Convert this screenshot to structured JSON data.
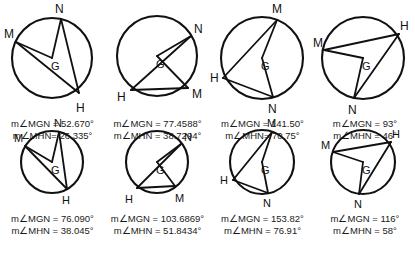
{
  "page": {
    "background_color": "#ffffff",
    "ink_color": "#111111",
    "rows": 2,
    "columns": 4
  },
  "vertex_names": {
    "m": "M",
    "n": "N",
    "h": "H",
    "g": "G"
  },
  "figures": [
    {
      "id": "figure-1",
      "position": "row1-col1",
      "measure_mgn": "m∠MGN = 52.670°",
      "measure_mhn": "m∠MHN= 26.335°",
      "center": {
        "label": "G",
        "cx": 52,
        "cy": 58,
        "r": 40
      },
      "points": {
        "M": {
          "x": 16,
          "y": 42,
          "label_x": 4,
          "label_y": 38
        },
        "N": {
          "x": 61,
          "y": 19,
          "label_x": 55,
          "label_y": 13
        },
        "H": {
          "x": 79,
          "y": 93,
          "label_x": 76,
          "label_y": 112
        }
      },
      "segments": [
        {
          "from": "M",
          "to": "G"
        },
        {
          "from": "M",
          "to": "H"
        },
        {
          "from": "N",
          "to": "G"
        },
        {
          "from": "N",
          "to": "H"
        }
      ]
    },
    {
      "id": "figure-2",
      "position": "row1-col2",
      "measure_mgn": "m∠MGN = 77.4588°",
      "measure_mhn": "m∠MHN = 38.7294°",
      "center": {
        "label": "G",
        "cx": 52,
        "cy": 56,
        "r": 40
      },
      "points": {
        "N": {
          "x": 86,
          "y": 36,
          "label_x": 89,
          "label_y": 33
        },
        "M": {
          "x": 83,
          "y": 88,
          "label_x": 87,
          "label_y": 98
        },
        "H": {
          "x": 26,
          "y": 90,
          "label_x": 12,
          "label_y": 101
        }
      },
      "segments": [
        {
          "from": "N",
          "to": "G"
        },
        {
          "from": "N",
          "to": "H"
        },
        {
          "from": "M",
          "to": "G"
        },
        {
          "from": "M",
          "to": "H"
        }
      ]
    },
    {
      "id": "figure-3",
      "position": "row1-col3",
      "measure_mgn": "m∠MGN = 141.50°",
      "measure_mhn": "m∠MHN= 70.75°",
      "center": {
        "label": "G",
        "cx": 52,
        "cy": 58,
        "r": 41
      },
      "points": {
        "M": {
          "x": 67,
          "y": 20,
          "label_x": 62,
          "label_y": 13
        },
        "H": {
          "x": 13,
          "y": 78,
          "label_x": 0,
          "label_y": 82
        },
        "N": {
          "x": 63,
          "y": 97,
          "label_x": 58,
          "label_y": 113
        }
      },
      "segments": [
        {
          "from": "M",
          "to": "G"
        },
        {
          "from": "M",
          "to": "H"
        },
        {
          "from": "N",
          "to": "G"
        },
        {
          "from": "N",
          "to": "H"
        }
      ]
    },
    {
      "id": "figure-4",
      "position": "row1-col4",
      "measure_mgn": "m∠MGN = 93°",
      "measure_mhn": "m∠MHN = 46°",
      "center": {
        "label": "G",
        "cx": 50,
        "cy": 58,
        "r": 41
      },
      "points": {
        "M": {
          "x": 11,
          "y": 50,
          "label_x": 0,
          "label_y": 47
        },
        "H": {
          "x": 86,
          "y": 34,
          "label_x": 87,
          "label_y": 30
        },
        "N": {
          "x": 41,
          "y": 98,
          "label_x": 35,
          "label_y": 114
        }
      },
      "segments": [
        {
          "from": "M",
          "to": "G"
        },
        {
          "from": "M",
          "to": "H"
        },
        {
          "from": "N",
          "to": "G"
        },
        {
          "from": "N",
          "to": "H"
        }
      ]
    },
    {
      "id": "figure-5",
      "position": "row2-col1",
      "measure_mgn": "m∠MGN = 76.090°",
      "measure_mhn": "m∠MHN = 38.045°",
      "center": {
        "label": "G",
        "cx": 52,
        "cy": 44,
        "r": 31
      },
      "points": {
        "M": {
          "x": 25,
          "y": 28,
          "label_x": 14,
          "label_y": 24
        },
        "N": {
          "x": 59,
          "y": 14,
          "label_x": 54,
          "label_y": 9
        },
        "H": {
          "x": 67,
          "y": 71,
          "label_x": 62,
          "label_y": 86
        }
      },
      "segments": [
        {
          "from": "M",
          "to": "G"
        },
        {
          "from": "M",
          "to": "H"
        },
        {
          "from": "N",
          "to": "G"
        },
        {
          "from": "N",
          "to": "H"
        }
      ]
    },
    {
      "id": "figure-6",
      "position": "row2-col2",
      "measure_mgn": "m∠MGN = 103.6869°",
      "measure_mhn": "m∠MHN = 51.8434°",
      "center": {
        "label": "G",
        "cx": 52,
        "cy": 44,
        "r": 31
      },
      "points": {
        "N": {
          "x": 76,
          "y": 26,
          "label_x": 79,
          "label_y": 23
        },
        "M": {
          "x": 70,
          "y": 68,
          "label_x": 70,
          "label_y": 84
        },
        "H": {
          "x": 32,
          "y": 70,
          "label_x": 20,
          "label_y": 85
        }
      },
      "segments": [
        {
          "from": "N",
          "to": "G"
        },
        {
          "from": "N",
          "to": "H"
        },
        {
          "from": "M",
          "to": "G"
        },
        {
          "from": "M",
          "to": "H"
        }
      ]
    },
    {
      "id": "figure-7",
      "position": "row2-col3",
      "measure_mgn": "m∠MGN = 153.82°",
      "measure_mhn": "m∠MHN = 76.91°",
      "center": {
        "label": "G",
        "cx": 52,
        "cy": 44,
        "r": 32
      },
      "points": {
        "M": {
          "x": 62,
          "y": 14,
          "label_x": 57,
          "label_y": 9
        },
        "H": {
          "x": 23,
          "y": 62,
          "label_x": 10,
          "label_y": 66
        },
        "N": {
          "x": 58,
          "y": 75,
          "label_x": 53,
          "label_y": 89
        }
      },
      "segments": [
        {
          "from": "M",
          "to": "G"
        },
        {
          "from": "M",
          "to": "H"
        },
        {
          "from": "N",
          "to": "G"
        },
        {
          "from": "N",
          "to": "H"
        }
      ]
    },
    {
      "id": "figure-8",
      "position": "row2-col4",
      "measure_mgn": "m∠MGN = 116°",
      "measure_mhn": "m∠MHN = 58°",
      "center": {
        "label": "G",
        "cx": 50,
        "cy": 44,
        "r": 32
      },
      "points": {
        "M": {
          "x": 20,
          "y": 34,
          "label_x": 8,
          "label_y": 31
        },
        "H": {
          "x": 78,
          "y": 24,
          "label_x": 79,
          "label_y": 20
        },
        "N": {
          "x": 46,
          "y": 76,
          "label_x": 41,
          "label_y": 90
        }
      },
      "segments": [
        {
          "from": "M",
          "to": "G"
        },
        {
          "from": "M",
          "to": "H"
        },
        {
          "from": "N",
          "to": "G"
        },
        {
          "from": "N",
          "to": "H"
        }
      ]
    }
  ]
}
